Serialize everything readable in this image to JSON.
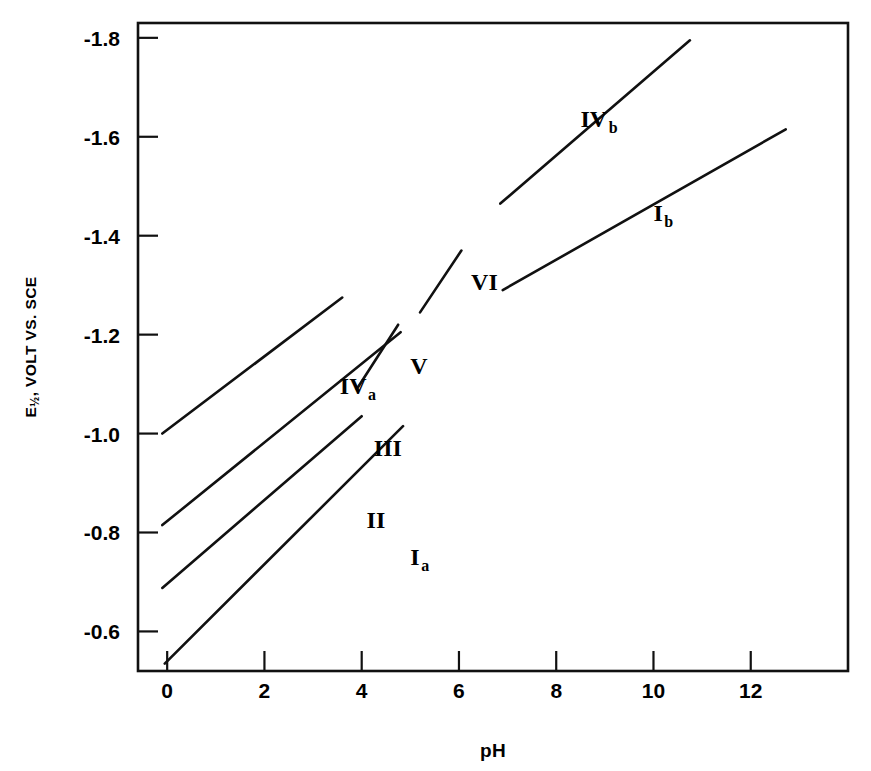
{
  "chart_data": {
    "type": "line",
    "title": "",
    "xlabel": "pH",
    "ylabel": "E½, VOLT VS. SCE",
    "ylabel_main": "E",
    "ylabel_sub": "½",
    "ylabel_rest": ", VOLT VS. SCE",
    "xlim": [
      -0.6,
      14.0
    ],
    "ylim": [
      -0.52,
      -1.83
    ],
    "xticks": [
      0,
      2,
      4,
      6,
      8,
      10,
      12
    ],
    "xtick_labels": [
      "0",
      "2",
      "4",
      "6",
      "8",
      "10",
      "12"
    ],
    "yticks": [
      -0.6,
      -0.8,
      -1.0,
      -1.2,
      -1.4,
      -1.6,
      -1.8
    ],
    "ytick_labels": [
      "-0.6",
      "-0.8",
      "-1.0",
      "-1.2",
      "-1.4",
      "-1.6",
      "-1.8"
    ],
    "grid": false,
    "legend": "inline-labels",
    "axis_color": "#111111",
    "line_color": "#111111",
    "background": "#ffffff",
    "series": [
      {
        "name": "Ia",
        "label_main": "I",
        "label_sub": "a",
        "x": [
          -0.05,
          4.85
        ],
        "values": [
          -0.535,
          -1.015
        ],
        "label_x": 5.0,
        "label_y": -0.735
      },
      {
        "name": "II",
        "label_main": "II",
        "label_sub": "",
        "x": [
          -0.1,
          4.0
        ],
        "values": [
          -0.688,
          -1.035
        ],
        "label_x": 4.1,
        "label_y": -0.81
      },
      {
        "name": "III",
        "label_main": "III",
        "label_sub": "",
        "x": [
          -0.1,
          4.8
        ],
        "values": [
          -0.815,
          -1.205
        ],
        "label_x": 4.25,
        "label_y": -0.955
      },
      {
        "name": "IVa",
        "label_main": "IV",
        "label_sub": "a",
        "x": [
          -0.1,
          3.6
        ],
        "values": [
          -1.0,
          -1.275
        ],
        "label_x": 3.55,
        "label_y": -1.08
      },
      {
        "name": "V",
        "label_main": "V",
        "label_sub": "",
        "x": [
          3.9,
          4.75
        ],
        "values": [
          -1.09,
          -1.22
        ],
        "label_x": 5.0,
        "label_y": -1.12
      },
      {
        "name": "VI",
        "label_main": "VI",
        "label_sub": "",
        "x": [
          5.2,
          6.05
        ],
        "values": [
          -1.245,
          -1.37
        ],
        "label_x": 6.25,
        "label_y": -1.29
      },
      {
        "name": "Ib",
        "label_main": "I",
        "label_sub": "b",
        "x": [
          6.9,
          12.72
        ],
        "values": [
          -1.29,
          -1.615
        ],
        "label_x": 10.0,
        "label_y": -1.43
      },
      {
        "name": "IVb",
        "label_main": "IV",
        "label_sub": "b",
        "x": [
          6.85,
          10.75
        ],
        "values": [
          -1.465,
          -1.795
        ],
        "label_x": 8.5,
        "label_y": -1.62
      }
    ]
  }
}
